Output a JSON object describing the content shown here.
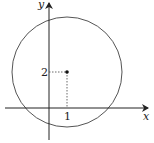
{
  "figure": {
    "axes": {
      "x_label": "x",
      "y_label": "y"
    },
    "circle": {
      "center": [
        1,
        2
      ],
      "center_label_x": "1",
      "center_label_y": "2"
    },
    "colors": {
      "stroke": "#555555",
      "axis": "#222222"
    }
  }
}
